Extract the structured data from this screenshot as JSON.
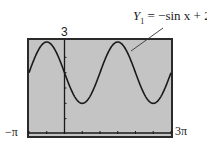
{
  "chart_data": {
    "type": "line",
    "title": "",
    "equation": "Y₁ = −sin x + 2",
    "equation_parts": {
      "y": "Y",
      "sub": "1",
      "rhs": "= −sin x + 2"
    },
    "function": "-sin(x) + 2",
    "xmin_label": "−π",
    "xmax_label": "3π",
    "ymax_label": "3",
    "xlim": [
      -3.14159,
      9.42478
    ],
    "ylim": [
      0,
      3
    ],
    "x_tick_spacing": "π/2",
    "y_tick_spacing": 0.5,
    "grid": false,
    "series": [
      {
        "name": "Y1 = -sin x + 2",
        "x": [
          -3.1416,
          -1.5708,
          0,
          1.5708,
          3.1416,
          4.7124,
          6.2832,
          7.854,
          9.4248
        ],
        "y": [
          2,
          3,
          2,
          1,
          2,
          3,
          2,
          1,
          2
        ]
      }
    ]
  },
  "colors": {
    "screen": "#c4c4c4",
    "frame": "#2a2a2a",
    "curve": "#1a1a1a",
    "axis": "#1a1a1a"
  }
}
